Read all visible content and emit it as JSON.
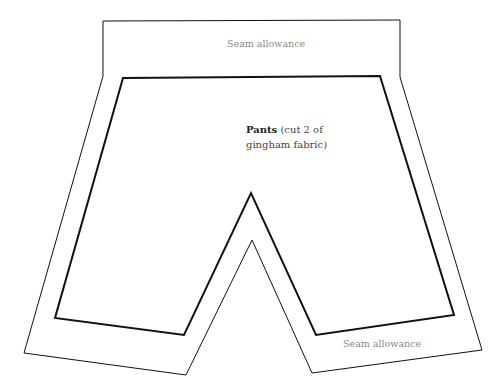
{
  "diagram": {
    "type": "sewing-pattern",
    "labels": {
      "seam_top": "Seam allowance",
      "seam_bottom": "Seam allowance",
      "piece_name": "Pants",
      "piece_note_line1": "(cut 2 of",
      "piece_note_line2": "gingham fabric)"
    },
    "colors": {
      "outline": "#111111",
      "label": "#8a8a8a",
      "background": "#ffffff"
    },
    "outer_outline_points": "103,21 400,20 400,77 482,350 312,373 252,240 186,375 24,353 103,76",
    "inner_outline_points": "123,78 380,76 454,315 316,335 251,193 184,335 55,318"
  }
}
